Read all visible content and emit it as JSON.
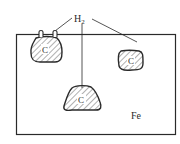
{
  "diagram": {
    "title": "",
    "gas_label": "H",
    "gas_subscript": "2",
    "matrix_label": "Fe",
    "inclusions": [
      {
        "id": "left",
        "label": "C"
      },
      {
        "id": "right",
        "label": "C"
      },
      {
        "id": "bottom",
        "label": "C"
      }
    ],
    "colors": {
      "stroke": "#2a2a2a",
      "background": "#ffffff"
    }
  }
}
